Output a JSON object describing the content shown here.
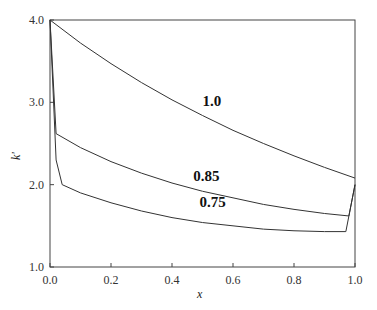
{
  "chart_data": {
    "type": "line",
    "title": "",
    "xlabel": "x_l^l",
    "ylabel": "k_c'",
    "xlim": [
      0,
      1
    ],
    "ylim": [
      1,
      4
    ],
    "xticks": [
      "0.0",
      "0.2",
      "0.4",
      "0.6",
      "0.8",
      "1.0"
    ],
    "yticks": [
      "1.0",
      "2.0",
      "3.0",
      "4.0"
    ],
    "grid": false,
    "series": [
      {
        "name": "1.0",
        "x": [
          0,
          0.1,
          0.2,
          0.3,
          0.4,
          0.5,
          0.6,
          0.7,
          0.8,
          0.9,
          1.0
        ],
        "y": [
          4.0,
          3.72,
          3.47,
          3.24,
          3.03,
          2.84,
          2.66,
          2.5,
          2.35,
          2.21,
          2.08
        ]
      },
      {
        "name": "0.85",
        "x": [
          0,
          0.02,
          0.1,
          0.2,
          0.3,
          0.4,
          0.5,
          0.6,
          0.7,
          0.8,
          0.9,
          0.98,
          1.0
        ],
        "y": [
          4.0,
          2.62,
          2.45,
          2.28,
          2.14,
          2.02,
          1.92,
          1.84,
          1.76,
          1.7,
          1.65,
          1.62,
          2.0
        ]
      },
      {
        "name": "0.75",
        "x": [
          0,
          0.02,
          0.04,
          0.1,
          0.2,
          0.3,
          0.4,
          0.5,
          0.6,
          0.7,
          0.8,
          0.9,
          0.97,
          1.0
        ],
        "y": [
          4.0,
          2.3,
          2.0,
          1.9,
          1.78,
          1.68,
          1.6,
          1.54,
          1.5,
          1.46,
          1.44,
          1.43,
          1.43,
          2.0
        ]
      }
    ],
    "annotations": [
      {
        "text": "1.0",
        "x": 0.5,
        "y": 2.95
      },
      {
        "text": "0.85",
        "x": 0.47,
        "y": 2.05
      },
      {
        "text": "0.75",
        "x": 0.49,
        "y": 1.73
      }
    ]
  }
}
